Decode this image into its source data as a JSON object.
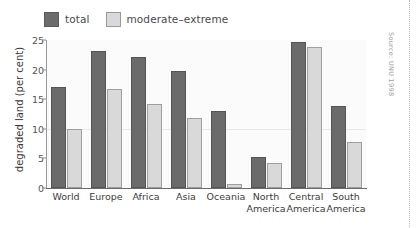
{
  "chart_data": {
    "type": "bar",
    "title": "",
    "subtitle": "",
    "xlabel": "",
    "ylabel": "degraded land (per cent)",
    "ylim": [
      0,
      25
    ],
    "yticks": [
      0,
      5,
      10,
      15,
      20,
      25
    ],
    "grid": true,
    "legend_position": "top-left",
    "categories": [
      "World",
      "Europe",
      "Africa",
      "Asia",
      "Oceania",
      "North America",
      "Central America",
      "South America"
    ],
    "series": [
      {
        "name": "total",
        "color": "#6b6b6b",
        "values": [
          17.1,
          23.1,
          22.1,
          19.8,
          13.0,
          5.3,
          24.6,
          13.8
        ]
      },
      {
        "name": "moderate–extreme",
        "color": "#d9d9d9",
        "values": [
          10.0,
          16.7,
          14.2,
          11.9,
          0.7,
          4.2,
          23.9,
          7.8
        ]
      }
    ],
    "annotations": [
      {
        "name": "source-note",
        "text": "Source: UNU 1998"
      }
    ]
  },
  "legend": {
    "entries": [
      {
        "label": "total",
        "swatch": "total-swatch",
        "color": "#6b6b6b"
      },
      {
        "label": "moderate–extreme",
        "swatch": "moderate-extreme-swatch",
        "color": "#d9d9d9"
      }
    ]
  },
  "axes": {
    "y_title": "degraded land (per cent)",
    "y_ticks": [
      "0",
      "5",
      "10",
      "15",
      "20",
      "25"
    ],
    "x_labels": [
      {
        "line1": "World",
        "line2": ""
      },
      {
        "line1": "Europe",
        "line2": ""
      },
      {
        "line1": "Africa",
        "line2": ""
      },
      {
        "line1": "Asia",
        "line2": ""
      },
      {
        "line1": "Oceania",
        "line2": ""
      },
      {
        "line1": "North",
        "line2": "America"
      },
      {
        "line1": "Central",
        "line2": "America"
      },
      {
        "line1": "South",
        "line2": "America"
      }
    ]
  },
  "source": {
    "text": "Source: UNU 1998"
  }
}
